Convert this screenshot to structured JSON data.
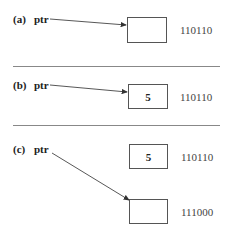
{
  "panels": [
    {
      "label": "(a)",
      "pointer_name": "ptr",
      "cells": [
        {
          "value": "",
          "address": "110110"
        }
      ],
      "pointer_target": "cell 0"
    },
    {
      "label": "(b)",
      "pointer_name": "ptr",
      "cells": [
        {
          "value": "5",
          "address": "110110"
        }
      ],
      "pointer_target": "cell 0"
    },
    {
      "label": "(c)",
      "pointer_name": "ptr",
      "cells": [
        {
          "value": "5",
          "address": "110110"
        },
        {
          "value": "",
          "address": "111000"
        }
      ],
      "pointer_target": "cell 1"
    }
  ],
  "colors": {
    "line": "#555555",
    "divider": "#888888",
    "text": "#222222"
  }
}
